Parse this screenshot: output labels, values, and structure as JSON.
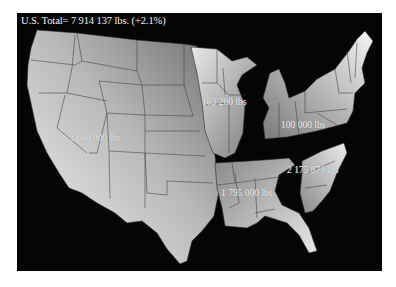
{
  "title": "U.S. Total= 7 914 137 lbs. (+2.1%)",
  "regions": [
    {
      "name": "West",
      "label": "3 680 000 lbs"
    },
    {
      "name": "Upper Midwest",
      "label": "163 260 lbs"
    },
    {
      "name": "Northeast / Great Lakes",
      "label": "100 000 lbs"
    },
    {
      "name": "South Central",
      "label": "1 795 000 lbs"
    },
    {
      "name": "Southeast",
      "label": "2 175 871 lbs"
    }
  ],
  "colors": {
    "background": "#050505",
    "region_light": "#e6e6e6",
    "region_dark": "#7a7a7a",
    "border": "#3a3a3a",
    "text": "#f0f0f0"
  }
}
